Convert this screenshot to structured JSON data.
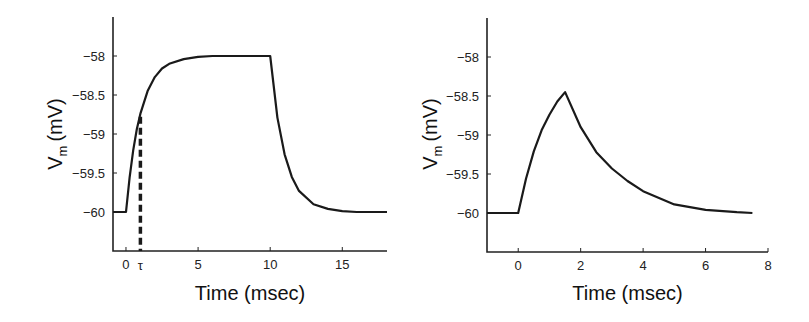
{
  "chart_data": [
    {
      "type": "line",
      "title": "",
      "xlabel": "Time (msec)",
      "ylabel": "V_m (mV)",
      "ylabel_main": "V",
      "ylabel_sub": "m",
      "ylabel_unit": "(mV)",
      "xlim": [
        -0.9,
        18.1
      ],
      "ylim": [
        -60.5,
        -57.5
      ],
      "xticks": [
        0,
        5,
        10,
        15
      ],
      "xticklabels": [
        "0",
        "5",
        "10",
        "15"
      ],
      "yticks": [
        -58,
        -58.5,
        -59,
        -59.5,
        -60
      ],
      "yticklabels": [
        "−58",
        "−58.5",
        "−59",
        "−59.5",
        "−60"
      ],
      "annotation": {
        "label": "τ",
        "x": 1.0,
        "y_top": -58.78,
        "style": "dashed vertical"
      },
      "grid": false,
      "series": [
        {
          "name": "Vm",
          "description": "Step current 0-10 msec, tau = 1 msec; rises from -60 to -58, decays back to -60",
          "x": [
            -0.9,
            0,
            0.25,
            0.5,
            0.75,
            1,
            1.5,
            2,
            2.5,
            3,
            4,
            5,
            6,
            8,
            10,
            10.5,
            11,
            11.5,
            12,
            13,
            14,
            15,
            16,
            17,
            18.1
          ],
          "y": [
            -60,
            -60,
            -59.56,
            -59.21,
            -58.94,
            -58.74,
            -58.45,
            -58.27,
            -58.16,
            -58.1,
            -58.04,
            -58.01,
            -58.0,
            -58.0,
            -58.0,
            -58.79,
            -59.26,
            -59.55,
            -59.73,
            -59.9,
            -59.96,
            -59.99,
            -60,
            -60,
            -60
          ]
        }
      ]
    },
    {
      "type": "line",
      "title": "",
      "xlabel": "Time (msec)",
      "ylabel": "V_m (mV)",
      "ylabel_main": "V",
      "ylabel_sub": "m",
      "ylabel_unit": "(mV)",
      "xlim": [
        -1,
        8
      ],
      "ylim": [
        -60.5,
        -57.5
      ],
      "xticks": [
        0,
        2,
        4,
        6,
        8
      ],
      "xticklabels": [
        "0",
        "2",
        "4",
        "6",
        "8"
      ],
      "yticks": [
        -58,
        -58.5,
        -59,
        -59.5,
        -60
      ],
      "yticklabels": [
        "−58",
        "−58.5",
        "−59",
        "−59.5",
        "−60"
      ],
      "grid": false,
      "series": [
        {
          "name": "Vm",
          "description": "Brief current pulse 0-1.5 msec; peaks near -58.45 mV then decays to -60",
          "x": [
            -1,
            0,
            0.25,
            0.5,
            0.75,
            1,
            1.25,
            1.5,
            2,
            2.5,
            3,
            3.5,
            4,
            5,
            6,
            7,
            7.5
          ],
          "y": [
            -60,
            -60,
            -59.56,
            -59.21,
            -58.94,
            -58.74,
            -58.57,
            -58.45,
            -58.9,
            -59.22,
            -59.43,
            -59.59,
            -59.72,
            -59.89,
            -59.96,
            -59.99,
            -60
          ]
        }
      ]
    }
  ]
}
